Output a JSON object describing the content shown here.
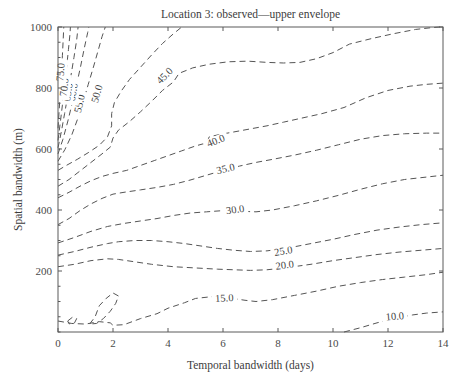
{
  "chart_data": {
    "type": "contour",
    "title": "Location 3: observed—upper envelope",
    "xlabel": "Temporal bandwidth (days)",
    "ylabel": "Spatial bandwidth (m)",
    "xlim": [
      0,
      14
    ],
    "ylim": [
      0,
      1000
    ],
    "xticks": [
      0,
      2,
      4,
      6,
      8,
      10,
      12,
      14
    ],
    "xtick_labels": [
      "0",
      "2",
      "4",
      "6",
      "8",
      "10",
      "12",
      "14"
    ],
    "yticks": [
      200,
      400,
      600,
      800,
      1000
    ],
    "ytick_labels": [
      "200",
      "400",
      "600",
      "800",
      "1000"
    ],
    "grid": false,
    "legend": "none",
    "line_style": "dashed",
    "line_color": "#555555",
    "contour_levels": [
      10.0,
      15.0,
      20.0,
      25.0,
      30.0,
      35.0,
      40.0,
      45.0,
      50.0,
      55.0,
      60.0,
      65.0,
      70.0,
      75.0
    ],
    "contour_label_texts": [
      "10.0",
      "15.0",
      "20.0",
      "25.0",
      "30.0",
      "35.0",
      "40.0",
      "45.0",
      "50.0",
      "55.0",
      "60.0",
      "65.0",
      "70.0",
      "75.0"
    ],
    "contours": [
      {
        "level": 10.0,
        "label": "10.0",
        "label_xy": [
          12.25,
          48
        ],
        "label_rotation": -5,
        "points": [
          [
            10.4,
            0
          ],
          [
            11.0,
            14
          ],
          [
            11.6,
            30
          ],
          [
            12.2,
            44
          ],
          [
            12.9,
            56
          ],
          [
            13.4,
            62
          ],
          [
            14.0,
            66
          ]
        ]
      },
      {
        "level": 15.0,
        "label": "15.0",
        "label_xy": [
          6.05,
          108
        ],
        "label_rotation": -3,
        "points": [
          [
            0.0,
            36
          ],
          [
            0.5,
            28
          ],
          [
            1.0,
            26
          ],
          [
            1.5,
            34
          ],
          [
            1.9,
            30
          ],
          [
            2.0,
            22
          ],
          [
            2.4,
            24
          ],
          [
            3.0,
            44
          ],
          [
            3.6,
            60
          ],
          [
            4.0,
            78
          ],
          [
            4.6,
            96
          ],
          [
            5.0,
            110
          ],
          [
            5.6,
            116
          ],
          [
            6.2,
            112
          ],
          [
            6.8,
            104
          ],
          [
            7.2,
            100
          ],
          [
            7.8,
            106
          ],
          [
            8.6,
            120
          ],
          [
            9.4,
            134
          ],
          [
            10.2,
            150
          ],
          [
            11.0,
            162
          ],
          [
            11.8,
            172
          ],
          [
            12.6,
            180
          ],
          [
            13.4,
            188
          ],
          [
            14.0,
            196
          ]
        ]
      },
      {
        "level": 20.0,
        "label": "20.0",
        "label_xy": [
          8.25,
          216
        ],
        "label_rotation": -7,
        "points": [
          [
            0.0,
            214
          ],
          [
            0.6,
            222
          ],
          [
            1.2,
            234
          ],
          [
            1.8,
            240
          ],
          [
            2.2,
            238
          ],
          [
            2.8,
            230
          ],
          [
            3.4,
            222
          ],
          [
            4.2,
            214
          ],
          [
            5.0,
            210
          ],
          [
            5.8,
            206
          ],
          [
            6.4,
            204
          ],
          [
            7.0,
            202
          ],
          [
            7.6,
            204
          ],
          [
            8.4,
            212
          ],
          [
            9.2,
            222
          ],
          [
            10.0,
            234
          ],
          [
            10.8,
            244
          ],
          [
            11.6,
            254
          ],
          [
            12.4,
            262
          ],
          [
            13.2,
            268
          ],
          [
            14.0,
            274
          ]
        ]
      },
      {
        "level": 25.0,
        "label": "25.0",
        "label_xy": [
          8.2,
          262
        ],
        "label_rotation": -9,
        "points": [
          [
            0.0,
            252
          ],
          [
            0.6,
            264
          ],
          [
            1.2,
            278
          ],
          [
            1.8,
            290
          ],
          [
            2.2,
            296
          ],
          [
            2.8,
            300
          ],
          [
            3.4,
            300
          ],
          [
            4.0,
            296
          ],
          [
            4.6,
            290
          ],
          [
            5.2,
            282
          ],
          [
            5.8,
            274
          ],
          [
            6.4,
            268
          ],
          [
            7.0,
            264
          ],
          [
            7.6,
            266
          ],
          [
            8.4,
            276
          ],
          [
            9.2,
            290
          ],
          [
            10.0,
            304
          ],
          [
            10.8,
            320
          ],
          [
            11.6,
            334
          ],
          [
            12.4,
            344
          ],
          [
            13.2,
            352
          ],
          [
            14.0,
            358
          ]
        ]
      },
      {
        "level": 30.0,
        "label": "30.0",
        "label_xy": [
          6.45,
          398
        ],
        "label_rotation": -8,
        "points": [
          [
            0.0,
            292
          ],
          [
            0.6,
            310
          ],
          [
            1.2,
            330
          ],
          [
            1.8,
            346
          ],
          [
            2.4,
            356
          ],
          [
            3.0,
            364
          ],
          [
            3.6,
            372
          ],
          [
            4.2,
            382
          ],
          [
            4.8,
            390
          ],
          [
            5.4,
            394
          ],
          [
            6.0,
            398
          ],
          [
            6.6,
            396
          ],
          [
            7.2,
            394
          ],
          [
            7.8,
            400
          ],
          [
            8.6,
            414
          ],
          [
            9.4,
            430
          ],
          [
            10.2,
            448
          ],
          [
            11.0,
            468
          ],
          [
            11.8,
            486
          ],
          [
            12.6,
            500
          ],
          [
            13.4,
            508
          ],
          [
            14.0,
            514
          ]
        ]
      },
      {
        "level": 35.0,
        "label": "35.0",
        "label_xy": [
          6.1,
          532
        ],
        "label_rotation": -13,
        "points": [
          [
            0.0,
            352
          ],
          [
            0.4,
            372
          ],
          [
            0.8,
            398
          ],
          [
            1.2,
            420
          ],
          [
            1.6,
            438
          ],
          [
            2.0,
            452
          ],
          [
            2.4,
            458
          ],
          [
            3.0,
            466
          ],
          [
            3.6,
            474
          ],
          [
            4.2,
            484
          ],
          [
            4.8,
            498
          ],
          [
            5.4,
            514
          ],
          [
            6.0,
            530
          ],
          [
            6.6,
            544
          ],
          [
            7.2,
            556
          ],
          [
            7.8,
            566
          ],
          [
            8.6,
            580
          ],
          [
            9.4,
            596
          ],
          [
            10.2,
            614
          ],
          [
            11.0,
            632
          ],
          [
            11.8,
            644
          ],
          [
            12.6,
            650
          ],
          [
            13.4,
            652
          ],
          [
            14.0,
            652
          ]
        ]
      },
      {
        "level": 40.0,
        "label": "40.0",
        "label_xy": [
          5.75,
          624
        ],
        "label_rotation": -22,
        "points": [
          [
            0.0,
            440
          ],
          [
            0.4,
            458
          ],
          [
            0.8,
            478
          ],
          [
            1.2,
            496
          ],
          [
            1.6,
            510
          ],
          [
            2.0,
            520
          ],
          [
            2.5,
            530
          ],
          [
            3.0,
            546
          ],
          [
            3.5,
            562
          ],
          [
            4.0,
            578
          ],
          [
            4.5,
            594
          ],
          [
            5.0,
            610
          ],
          [
            5.4,
            620
          ],
          [
            5.5,
            640
          ],
          [
            5.9,
            648
          ],
          [
            6.4,
            656
          ],
          [
            7.0,
            666
          ],
          [
            7.6,
            676
          ],
          [
            8.2,
            688
          ],
          [
            8.8,
            700
          ],
          [
            9.6,
            716
          ],
          [
            10.4,
            736
          ],
          [
            11.2,
            768
          ],
          [
            12.0,
            792
          ],
          [
            12.8,
            806
          ],
          [
            13.4,
            812
          ],
          [
            14.0,
            816
          ]
        ]
      },
      {
        "level": 45.0,
        "label": "45.0",
        "label_xy": [
          3.9,
          838
        ],
        "label_rotation": -45,
        "points": [
          [
            0.0,
            478
          ],
          [
            0.4,
            500
          ],
          [
            0.8,
            528
          ],
          [
            1.2,
            556
          ],
          [
            1.6,
            584
          ],
          [
            1.9,
            606
          ],
          [
            2.0,
            636
          ],
          [
            2.2,
            662
          ],
          [
            2.6,
            690
          ],
          [
            3.0,
            722
          ],
          [
            3.4,
            756
          ],
          [
            3.8,
            792
          ],
          [
            4.2,
            820
          ],
          [
            4.4,
            848
          ],
          [
            4.9,
            866
          ],
          [
            5.5,
            878
          ],
          [
            6.2,
            886
          ],
          [
            6.9,
            888
          ],
          [
            7.6,
            884
          ],
          [
            8.2,
            882
          ],
          [
            8.8,
            884
          ],
          [
            9.4,
            896
          ],
          [
            10.0,
            916
          ],
          [
            10.6,
            944
          ],
          [
            11.4,
            962
          ],
          [
            12.2,
            978
          ],
          [
            13.0,
            992
          ],
          [
            13.6,
            998
          ],
          [
            13.9,
            1000
          ]
        ]
      },
      {
        "level": 50.0,
        "label": "50.0",
        "label_xy": [
          1.45,
          780
        ],
        "label_rotation": -74,
        "points": [
          [
            0.0,
            530
          ],
          [
            0.3,
            546
          ],
          [
            0.7,
            566
          ],
          [
            1.1,
            588
          ],
          [
            1.5,
            612
          ],
          [
            1.8,
            640
          ],
          [
            1.95,
            676
          ],
          [
            1.95,
            716
          ],
          [
            2.05,
            752
          ],
          [
            2.3,
            790
          ],
          [
            2.6,
            828
          ],
          [
            3.0,
            868
          ],
          [
            3.4,
            908
          ],
          [
            3.8,
            946
          ],
          [
            4.2,
            978
          ],
          [
            4.5,
            1000
          ]
        ]
      },
      {
        "level": 55.0,
        "label": "55.0",
        "label_xy": [
          0.82,
          748
        ],
        "label_rotation": -77,
        "points": [
          [
            0.0,
            560
          ],
          [
            0.25,
            598
          ],
          [
            0.5,
            646
          ],
          [
            0.72,
            700
          ],
          [
            0.92,
            756
          ],
          [
            1.1,
            812
          ],
          [
            1.28,
            866
          ],
          [
            1.45,
            920
          ],
          [
            1.6,
            968
          ],
          [
            1.72,
            1000
          ]
        ]
      },
      {
        "level": 60.0,
        "label": "60.0",
        "label_xy": [
          0.58,
          786
        ],
        "label_rotation": -80,
        "points": [
          [
            0.0,
            584
          ],
          [
            0.18,
            632
          ],
          [
            0.36,
            692
          ],
          [
            0.52,
            752
          ],
          [
            0.68,
            812
          ],
          [
            0.82,
            870
          ],
          [
            0.95,
            928
          ],
          [
            1.08,
            982
          ],
          [
            1.12,
            1000
          ]
        ]
      },
      {
        "level": 65.0,
        "label": "65.0",
        "label_xy": [
          0.4,
          786
        ],
        "label_rotation": -82,
        "points": [
          [
            0.0,
            604
          ],
          [
            0.12,
            656
          ],
          [
            0.24,
            716
          ],
          [
            0.36,
            778
          ],
          [
            0.47,
            840
          ],
          [
            0.58,
            900
          ],
          [
            0.68,
            958
          ],
          [
            0.73,
            1000
          ]
        ]
      },
      {
        "level": 70.0,
        "label": "70.0",
        "label_xy": [
          0.26,
          802
        ],
        "label_rotation": -84,
        "points": [
          [
            0.0,
            628
          ],
          [
            0.08,
            684
          ],
          [
            0.16,
            744
          ],
          [
            0.24,
            806
          ],
          [
            0.31,
            866
          ],
          [
            0.38,
            926
          ],
          [
            0.44,
            982
          ],
          [
            0.45,
            1000
          ]
        ]
      },
      {
        "level": 75.0,
        "label": "75.0",
        "label_xy": [
          0.13,
          852
        ],
        "label_rotation": -86,
        "points": [
          [
            0.0,
            668
          ],
          [
            0.04,
            724
          ],
          [
            0.08,
            784
          ],
          [
            0.12,
            846
          ],
          [
            0.16,
            906
          ],
          [
            0.19,
            962
          ],
          [
            0.21,
            1000
          ]
        ]
      }
    ],
    "closed_contours": [
      {
        "level": 15.0,
        "label": "",
        "points": [
          [
            1.15,
            26
          ],
          [
            1.35,
            50
          ],
          [
            1.5,
            86
          ],
          [
            1.75,
            110
          ],
          [
            2.0,
            128
          ],
          [
            2.2,
            118
          ],
          [
            2.1,
            94
          ],
          [
            1.9,
            68
          ],
          [
            1.65,
            44
          ],
          [
            1.4,
            28
          ],
          [
            1.15,
            26
          ]
        ]
      },
      {
        "level": 15.0,
        "label": "",
        "points": [
          [
            0.35,
            36
          ],
          [
            0.52,
            48
          ],
          [
            0.68,
            44
          ],
          [
            0.6,
            30
          ],
          [
            0.42,
            26
          ],
          [
            0.35,
            36
          ]
        ]
      }
    ]
  }
}
